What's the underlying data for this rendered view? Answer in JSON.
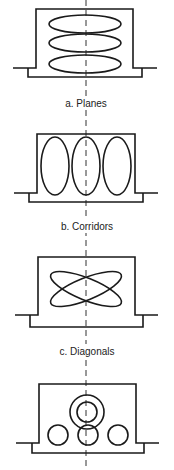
{
  "diagram": {
    "stroke_color": "#1a1a1a",
    "background": "#ffffff",
    "panels": [
      {
        "id": "a",
        "label": "a. Planes",
        "pattern": "three stacked horizontal ellipses"
      },
      {
        "id": "b",
        "label": "b. Corridors",
        "pattern": "three side-by-side vertical ellipses"
      },
      {
        "id": "c",
        "label": "c. Diagonals",
        "pattern": "two crossing diagonal ellipses"
      },
      {
        "id": "d",
        "label": "",
        "pattern": "concentric rings above three small circles"
      }
    ]
  }
}
